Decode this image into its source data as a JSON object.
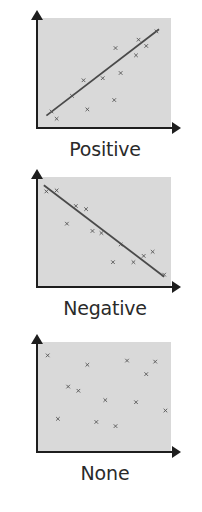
{
  "chart_data": [
    {
      "type": "scatter",
      "title": "Positive",
      "xlabel": "",
      "ylabel": "",
      "grid": false,
      "xlim": [
        0,
        10
      ],
      "ylim": [
        0,
        10
      ],
      "points": [
        [
          0.9,
          1.3
        ],
        [
          1.3,
          0.6
        ],
        [
          2.5,
          2.8
        ],
        [
          3.4,
          4.3
        ],
        [
          3.7,
          1.5
        ],
        [
          4.9,
          4.5
        ],
        [
          5.8,
          2.4
        ],
        [
          5.9,
          7.4
        ],
        [
          6.3,
          5.0
        ],
        [
          7.5,
          6.7
        ],
        [
          7.7,
          8.2
        ],
        [
          8.3,
          7.6
        ],
        [
          9.1,
          9.0
        ]
      ],
      "trendline": {
        "from": [
          0.5,
          0.9
        ],
        "to": [
          9.3,
          9.2
        ]
      },
      "marker": "x"
    },
    {
      "type": "scatter",
      "title": "Negative",
      "xlabel": "",
      "ylabel": "",
      "grid": false,
      "xlim": [
        0,
        10
      ],
      "ylim": [
        0,
        10
      ],
      "points": [
        [
          0.5,
          8.9
        ],
        [
          1.3,
          9.0
        ],
        [
          2.1,
          5.8
        ],
        [
          2.8,
          7.5
        ],
        [
          3.6,
          7.2
        ],
        [
          4.1,
          5.1
        ],
        [
          4.8,
          4.9
        ],
        [
          5.7,
          2.1
        ],
        [
          6.3,
          3.8
        ],
        [
          7.3,
          2.1
        ],
        [
          8.1,
          2.7
        ],
        [
          8.8,
          3.1
        ],
        [
          9.7,
          0.9
        ]
      ],
      "trendline": {
        "from": [
          0.3,
          9.5
        ],
        "to": [
          9.7,
          0.7
        ]
      },
      "marker": "x"
    },
    {
      "type": "scatter",
      "title": "None",
      "xlabel": "",
      "ylabel": "",
      "grid": false,
      "xlim": [
        0,
        10
      ],
      "ylim": [
        0,
        10
      ],
      "points": [
        [
          0.6,
          9.0
        ],
        [
          1.4,
          2.9
        ],
        [
          2.2,
          6.0
        ],
        [
          3.0,
          5.6
        ],
        [
          3.7,
          8.1
        ],
        [
          4.4,
          2.6
        ],
        [
          5.1,
          4.7
        ],
        [
          5.9,
          2.2
        ],
        [
          6.8,
          8.5
        ],
        [
          7.5,
          4.5
        ],
        [
          8.3,
          7.2
        ],
        [
          9.0,
          8.4
        ],
        [
          9.8,
          3.7
        ]
      ],
      "trendline": null,
      "marker": "x"
    }
  ],
  "panels": [
    {
      "label": "Positive"
    },
    {
      "label": "Negative"
    },
    {
      "label": "None"
    }
  ],
  "colors": {
    "plot_bg": "#d9d9d9",
    "axis": "#1e1e1e",
    "marker": "#555555",
    "trendline": "#4a4a4a",
    "label": "#2a2a2a"
  }
}
